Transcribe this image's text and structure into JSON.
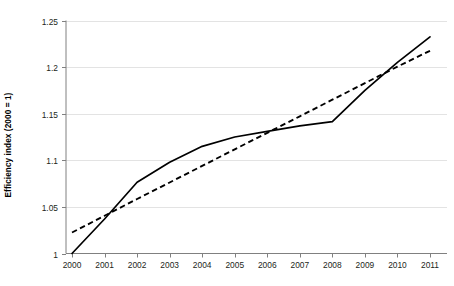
{
  "chart_data": {
    "type": "line",
    "title": "",
    "xlabel": "",
    "ylabel": "Efficiency index (2000 = 1)",
    "categories": [
      "2000",
      "2001",
      "2002",
      "2003",
      "2004",
      "2005",
      "2006",
      "2007",
      "2008",
      "2009",
      "2010",
      "2011"
    ],
    "x": [
      2000,
      2001,
      2002,
      2003,
      2004,
      2005,
      2006,
      2007,
      2008,
      2009,
      2010,
      2011
    ],
    "xlim": [
      2000,
      2011
    ],
    "ylim": [
      1,
      1.25
    ],
    "yticks": [
      1,
      1.05,
      1.1,
      1.15,
      1.2,
      1.25
    ],
    "ytick_labels": [
      "1",
      "1.05",
      "1.1",
      "1.15",
      "1.2",
      "1.25"
    ],
    "grid": "horizontal",
    "legend": "none",
    "series": [
      {
        "name": "Efficiency index",
        "style": "solid",
        "color": "#000000",
        "values": [
          1.0,
          1.037,
          1.0765,
          1.098,
          1.115,
          1.125,
          1.131,
          1.137,
          1.1415,
          1.175,
          1.205,
          1.2325
        ]
      },
      {
        "name": "Linear trend",
        "style": "dashed",
        "color": "#000000",
        "values": [
          1.0225,
          1.0405,
          1.0585,
          1.0762,
          1.094,
          1.1118,
          1.1295,
          1.1472,
          1.165,
          1.1828,
          1.2005,
          1.2175
        ]
      }
    ]
  },
  "axes": {
    "y_axis_title": "Efficiency index (2000 = 1)"
  }
}
